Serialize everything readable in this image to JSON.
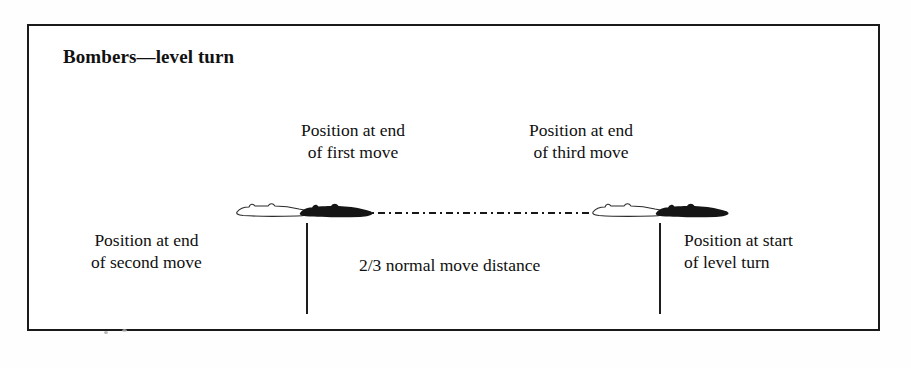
{
  "figure": {
    "title": "Bombers—level turn",
    "frame_color": "#1a1a1a",
    "background_color": "#ffffff"
  },
  "captions": {
    "first_move": {
      "line1": "Position at end",
      "line2": "of first move"
    },
    "third_move": {
      "line1": "Position at end",
      "line2": "of third move"
    },
    "second_move": {
      "line1": "Position at end",
      "line2": "of second move"
    },
    "start_of_turn": {
      "line1": "Position at start",
      "line2": "of level turn"
    },
    "distance": "2/3 normal move distance"
  },
  "markers": {
    "travel_line_style": "dash-dot",
    "tick_left": "measurement-tick",
    "tick_right": "measurement-tick"
  },
  "aircraft": [
    {
      "id": "ghost-left",
      "style": "outline",
      "name": "bomber-outline-silhouette"
    },
    {
      "id": "solid-left",
      "style": "solid",
      "name": "bomber-solid-silhouette"
    },
    {
      "id": "ghost-right",
      "style": "outline",
      "name": "bomber-outline-silhouette"
    },
    {
      "id": "solid-right",
      "style": "solid",
      "name": "bomber-solid-silhouette"
    }
  ],
  "colors": {
    "ink": "#111111",
    "line": "#181818",
    "speck": "#b9b9b9"
  }
}
